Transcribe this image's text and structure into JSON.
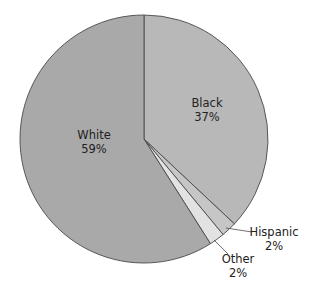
{
  "chart_data": {
    "type": "pie",
    "title": "",
    "start_angle_deg": 0,
    "direction": "clockwise",
    "slices": [
      {
        "label": "Black",
        "value": 37,
        "pct_label": "37%",
        "color": "#b8b8b8"
      },
      {
        "label": "Hispanic",
        "value": 2,
        "pct_label": "2%",
        "color": "#c6c6c6"
      },
      {
        "label": "Other",
        "value": 2,
        "pct_label": "2%",
        "color": "#e2e2e2"
      },
      {
        "label": "White",
        "value": 59,
        "pct_label": "59%",
        "color": "#a9a9a9"
      }
    ],
    "legend": "none",
    "stroke_color": "#4a4a4a"
  },
  "labels": {
    "black": {
      "name": "Black",
      "pct": "37%"
    },
    "white": {
      "name": "White",
      "pct": "59%"
    },
    "hispanic": {
      "name": "Hispanic",
      "pct": "2%"
    },
    "other": {
      "name": "Other",
      "pct": "2%"
    }
  }
}
